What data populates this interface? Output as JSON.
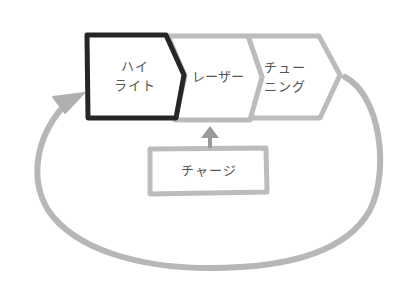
{
  "diagram": {
    "type": "process-cycle",
    "stages": [
      {
        "id": "highlight",
        "label": "ハイ\nライト",
        "emphasized": true
      },
      {
        "id": "laser",
        "label": "レーザー",
        "emphasized": false
      },
      {
        "id": "tuning",
        "label": "チュー\nニング",
        "emphasized": false
      }
    ],
    "input": {
      "id": "charge",
      "label": "チャージ",
      "feeds_into": "laser"
    },
    "loop": {
      "from": "tuning",
      "to": "highlight"
    },
    "colors": {
      "emphasis_stroke": "#2b2b2b",
      "normal_stroke": "#b9b9b9",
      "loop_stroke": "#b5b5b5",
      "text": "#555555",
      "background": "#ffffff"
    }
  }
}
